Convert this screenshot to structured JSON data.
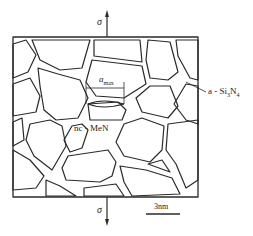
{
  "diagram": {
    "type": "nanocomposite microstructure schematic",
    "labels": {
      "sigma_top": "σ",
      "sigma_bottom": "σ",
      "a_max_base": "a",
      "a_max_sub": "max",
      "matrix_label": "a - Si",
      "matrix_sub1": "3",
      "matrix_mid": "N",
      "matrix_sub2": "4",
      "grain_label": "nc - MeN",
      "scale_bar": "3nm"
    },
    "colors": {
      "line": "#2a2a2a",
      "background": "#ffffff"
    }
  }
}
